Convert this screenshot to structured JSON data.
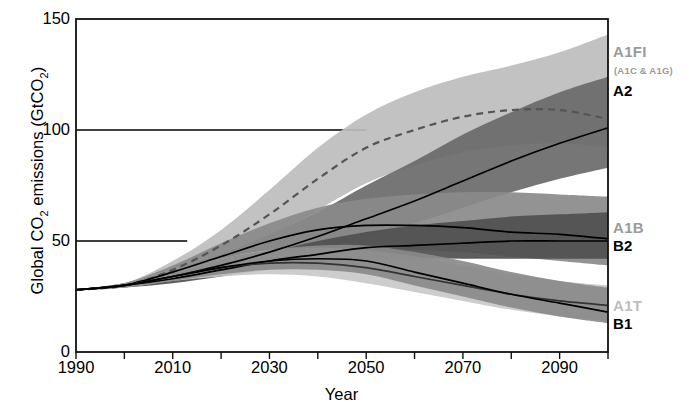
{
  "chart_data": {
    "type": "area",
    "title": "",
    "xlabel": "Year",
    "ylabel": "Global CO2 emissions (GtCO2)",
    "ylabel_parts": {
      "pre": "Global CO",
      "sub1": "2",
      "mid": " emissions (GtCO",
      "sub2": "2",
      "post": ")"
    },
    "xlim": [
      1990,
      2100
    ],
    "ylim": [
      0,
      150
    ],
    "yticks": [
      0,
      50,
      100,
      150
    ],
    "ytick_labels": [
      "0",
      "50",
      "100",
      "150"
    ],
    "xticks": [
      1990,
      2010,
      2030,
      2050,
      2070,
      2090
    ],
    "xtick_labels": [
      "1990",
      "2010",
      "2030",
      "2050",
      "2070",
      "2090"
    ],
    "xminor_step": 10,
    "grid": "partial-horizontal",
    "gridlines": [
      {
        "y": 100,
        "x_from": 1990,
        "x_to": 2050
      },
      {
        "y": 50,
        "x_from": 1990,
        "x_to": 2013
      }
    ],
    "legend_position": "right-outside",
    "series": [
      {
        "name": "A1FI",
        "sublabel": "(A1C & A1G)",
        "color": "#bdbdbd",
        "line_style": "dashed",
        "line_color": "#555555",
        "x": [
          1990,
          2000,
          2010,
          2020,
          2030,
          2040,
          2050,
          2060,
          2070,
          2080,
          2090,
          2100
        ],
        "median": [
          28,
          30,
          37,
          48,
          62,
          78,
          92,
          100,
          106,
          109,
          109,
          105
        ],
        "lower": [
          28,
          29,
          34,
          42,
          52,
          64,
          76,
          84,
          90,
          93,
          94,
          92
        ],
        "upper": [
          28,
          31,
          41,
          55,
          73,
          92,
          107,
          117,
          124,
          129,
          135,
          143
        ]
      },
      {
        "name": "A2",
        "color": "#6a6a6a",
        "line_style": "solid",
        "line_color": "#000000",
        "x": [
          1990,
          2000,
          2010,
          2020,
          2030,
          2040,
          2050,
          2060,
          2070,
          2080,
          2090,
          2100
        ],
        "median": [
          28,
          30,
          34,
          39,
          45,
          52,
          60,
          68,
          77,
          86,
          94,
          101
        ],
        "lower": [
          28,
          29,
          32,
          36,
          41,
          46,
          52,
          58,
          65,
          72,
          78,
          83
        ],
        "upper": [
          28,
          31,
          37,
          44,
          53,
          63,
          75,
          86,
          98,
          108,
          117,
          124
        ]
      },
      {
        "name": "A1B",
        "color": "#8a8a8a",
        "line_style": "solid",
        "line_color": "#000000",
        "x": [
          1990,
          2000,
          2010,
          2020,
          2030,
          2040,
          2050,
          2060,
          2070,
          2080,
          2090,
          2100
        ],
        "median": [
          28,
          30,
          36,
          43,
          50,
          55,
          57,
          57,
          56,
          54,
          53,
          51
        ],
        "lower": [
          28,
          29,
          33,
          38,
          43,
          46,
          47,
          46,
          45,
          43,
          41,
          39
        ],
        "upper": [
          28,
          31,
          39,
          49,
          58,
          65,
          69,
          71,
          72,
          72,
          71,
          70
        ]
      },
      {
        "name": "B2",
        "color": "#4f4f4f",
        "line_style": "solid",
        "line_color": "#000000",
        "x": [
          1990,
          2000,
          2010,
          2020,
          2030,
          2040,
          2050,
          2060,
          2070,
          2080,
          2090,
          2100
        ],
        "median": [
          28,
          30,
          33,
          37,
          41,
          44,
          47,
          48,
          49,
          50,
          50,
          50
        ],
        "lower": [
          28,
          29,
          31,
          34,
          37,
          39,
          41,
          42,
          42,
          42,
          42,
          42
        ],
        "upper": [
          28,
          31,
          35,
          40,
          45,
          50,
          54,
          57,
          59,
          61,
          62,
          63
        ]
      },
      {
        "name": "A1T",
        "color": "#c9c9c9",
        "line_style": "solid",
        "line_color": "#333333",
        "x": [
          1990,
          2000,
          2010,
          2020,
          2030,
          2040,
          2050,
          2060,
          2070,
          2080,
          2090,
          2100
        ],
        "median": [
          28,
          30,
          34,
          38,
          40,
          40,
          38,
          34,
          30,
          26,
          23,
          21
        ],
        "lower": [
          28,
          29,
          32,
          34,
          35,
          34,
          31,
          27,
          23,
          19,
          16,
          14
        ],
        "upper": [
          28,
          31,
          37,
          42,
          46,
          47,
          46,
          43,
          39,
          35,
          32,
          30
        ]
      },
      {
        "name": "B1",
        "color": "#8a8a8a",
        "line_style": "solid",
        "line_color": "#000000",
        "x": [
          1990,
          2000,
          2010,
          2020,
          2030,
          2040,
          2050,
          2060,
          2070,
          2080,
          2090,
          2100
        ],
        "median": [
          28,
          30,
          34,
          38,
          41,
          42,
          41,
          36,
          31,
          26,
          22,
          18
        ],
        "lower": [
          28,
          29,
          32,
          35,
          37,
          37,
          35,
          30,
          25,
          20,
          16,
          13
        ],
        "upper": [
          28,
          31,
          37,
          42,
          46,
          48,
          48,
          45,
          41,
          36,
          32,
          29
        ]
      }
    ]
  },
  "legend": [
    {
      "label": "A1FI",
      "tone": "gray",
      "x": 613,
      "y": 44
    },
    {
      "label": "(A1C & A1G)",
      "tone": "sub",
      "x": 614,
      "y": 66
    },
    {
      "label": "A2",
      "tone": "black",
      "x": 613,
      "y": 83
    },
    {
      "label": "A1B",
      "tone": "gray",
      "x": 613,
      "y": 220
    },
    {
      "label": "B2",
      "tone": "black",
      "x": 613,
      "y": 238
    },
    {
      "label": "A1T",
      "tone": "ltgray",
      "x": 613,
      "y": 298
    },
    {
      "label": "B1",
      "tone": "black",
      "x": 613,
      "y": 316
    }
  ]
}
